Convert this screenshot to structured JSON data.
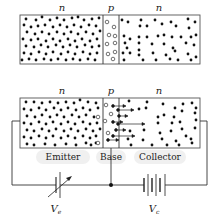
{
  "diagram": {
    "top": {
      "region_labels": [
        "n",
        "p",
        "n"
      ]
    },
    "bottom": {
      "region_labels": [
        "n",
        "p",
        "n"
      ],
      "terminal_labels": {
        "emitter": "Emitter",
        "base": "Base",
        "collector": "Collector"
      }
    },
    "sources": {
      "emitter_source": {
        "symbol": "V",
        "subscript": "e",
        "type": "variable-source"
      },
      "collector_source": {
        "symbol": "V",
        "subscript": "c",
        "type": "battery"
      }
    },
    "legend": {
      "filled_dot": "electron",
      "open_circle": "hole"
    },
    "colors": {
      "line": "#333333",
      "dot": "#111111",
      "label_bg": "#f0f0f0"
    }
  }
}
